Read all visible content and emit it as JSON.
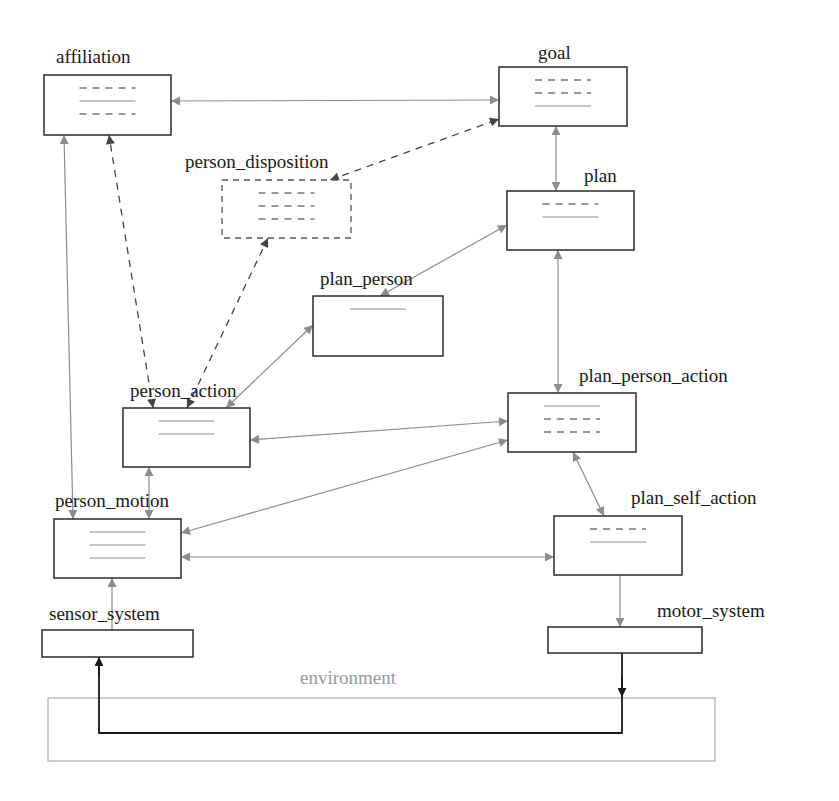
{
  "diagram": {
    "nodes": [
      {
        "id": "affiliation",
        "label": "affiliation",
        "x": 44,
        "y": 75,
        "w": 127,
        "h": 60,
        "style": "solid",
        "lx": 56,
        "ly": 63,
        "attrs": [
          "dashed",
          "solid",
          "dashed"
        ]
      },
      {
        "id": "goal",
        "label": "goal",
        "x": 499,
        "y": 67,
        "w": 128,
        "h": 59,
        "style": "solid",
        "lx": 538,
        "ly": 59,
        "attrs": [
          "dashed",
          "dashed",
          "solid"
        ]
      },
      {
        "id": "person_disposition",
        "label": "person_disposition",
        "x": 222,
        "y": 180,
        "w": 129,
        "h": 58,
        "style": "dashed",
        "lx": 185,
        "ly": 168,
        "attrs": [
          "dashed",
          "dashed",
          "dashed"
        ]
      },
      {
        "id": "plan",
        "label": "plan",
        "x": 507,
        "y": 191,
        "w": 127,
        "h": 59,
        "style": "solid",
        "lx": 584,
        "ly": 182,
        "attrs": [
          "dashed",
          "solid"
        ]
      },
      {
        "id": "plan_person",
        "label": "plan_person",
        "x": 313,
        "y": 296,
        "w": 130,
        "h": 60,
        "style": "solid",
        "lx": 320,
        "ly": 285,
        "attrs": [
          "solid"
        ]
      },
      {
        "id": "person_action",
        "label": "person_action",
        "x": 123,
        "y": 408,
        "w": 127,
        "h": 59,
        "style": "solid",
        "lx": 130,
        "ly": 397,
        "attrs": [
          "solid",
          "solid"
        ]
      },
      {
        "id": "plan_person_action",
        "label": "plan_person_action",
        "x": 508,
        "y": 393,
        "w": 128,
        "h": 59,
        "style": "solid",
        "lx": 579,
        "ly": 382,
        "attrs": [
          "solid",
          "dashed",
          "dashed"
        ]
      },
      {
        "id": "person_motion",
        "label": "person_motion",
        "x": 54,
        "y": 519,
        "w": 127,
        "h": 59,
        "style": "solid",
        "lx": 55,
        "ly": 507,
        "attrs": [
          "solid",
          "solid",
          "solid"
        ]
      },
      {
        "id": "plan_self_action",
        "label": "plan_self_action",
        "x": 554,
        "y": 516,
        "w": 128,
        "h": 59,
        "style": "solid",
        "lx": 631,
        "ly": 504,
        "attrs": [
          "dashed",
          "solid"
        ]
      },
      {
        "id": "sensor_system",
        "label": "sensor_system",
        "x": 42,
        "y": 630,
        "w": 151,
        "h": 27,
        "style": "solid",
        "lx": 49,
        "ly": 620,
        "attrs": []
      },
      {
        "id": "motor_system",
        "label": "motor_system",
        "x": 548,
        "y": 627,
        "w": 154,
        "h": 26,
        "style": "solid",
        "lx": 657,
        "ly": 617,
        "attrs": []
      }
    ],
    "environment": {
      "label": "environment",
      "x": 48,
      "y": 698,
      "w": 667,
      "h": 63,
      "lx": 300,
      "ly": 684
    },
    "edges": [
      {
        "from": "goal",
        "to": "affiliation",
        "type": "bi",
        "x1": 171,
        "y1": 101,
        "x2": 499,
        "y2": 100
      },
      {
        "from": "person_disposition",
        "to": "goal",
        "type": "bi-dashed",
        "x1": 330,
        "y1": 180,
        "x2": 499,
        "y2": 119
      },
      {
        "from": "goal",
        "to": "plan",
        "type": "bi",
        "x1": 556,
        "y1": 126,
        "x2": 556,
        "y2": 191
      },
      {
        "from": "plan_person",
        "to": "plan",
        "type": "bi",
        "x1": 380,
        "y1": 296,
        "x2": 507,
        "y2": 225
      },
      {
        "from": "plan",
        "to": "plan_person_action",
        "type": "bi",
        "x1": 558,
        "y1": 250,
        "x2": 558,
        "y2": 393
      },
      {
        "from": "person_action",
        "to": "plan_person",
        "type": "bi",
        "x1": 226,
        "y1": 408,
        "x2": 313,
        "y2": 325
      },
      {
        "from": "person_action",
        "to": "affiliation",
        "type": "bi-dashed",
        "x1": 153,
        "y1": 408,
        "x2": 109,
        "y2": 135
      },
      {
        "from": "person_action",
        "to": "person_disposition",
        "type": "bi-dashed",
        "x1": 187,
        "y1": 408,
        "x2": 268,
        "y2": 238
      },
      {
        "from": "person_motion",
        "to": "affiliation",
        "type": "bi",
        "x1": 73,
        "y1": 519,
        "x2": 64,
        "y2": 135
      },
      {
        "from": "person_action",
        "to": "plan_person_action",
        "type": "bi",
        "x1": 250,
        "y1": 440,
        "x2": 508,
        "y2": 421
      },
      {
        "from": "person_motion",
        "to": "plan_person_action",
        "type": "bi",
        "x1": 181,
        "y1": 533,
        "x2": 508,
        "y2": 440
      },
      {
        "from": "person_motion",
        "to": "person_action",
        "type": "bi",
        "x1": 149,
        "y1": 519,
        "x2": 149,
        "y2": 467
      },
      {
        "from": "person_motion",
        "to": "plan_self_action",
        "type": "bi",
        "x1": 181,
        "y1": 557,
        "x2": 554,
        "y2": 557
      },
      {
        "from": "plan_person_action",
        "to": "plan_self_action",
        "type": "bi",
        "x1": 573,
        "y1": 452,
        "x2": 604,
        "y2": 516
      },
      {
        "from": "sensor_system",
        "to": "person_motion",
        "type": "uni",
        "x1": 112,
        "y1": 630,
        "x2": 112,
        "y2": 578
      },
      {
        "from": "plan_self_action",
        "to": "motor_system",
        "type": "uni",
        "x1": 620,
        "y1": 575,
        "x2": 620,
        "y2": 627
      }
    ],
    "loop_path": {
      "points": "622,653 622,733 99,733 99,657",
      "arrow_down_x": 622,
      "arrow_down_y": 697,
      "arrow_up_x": 99,
      "arrow_up_y": 657
    }
  }
}
